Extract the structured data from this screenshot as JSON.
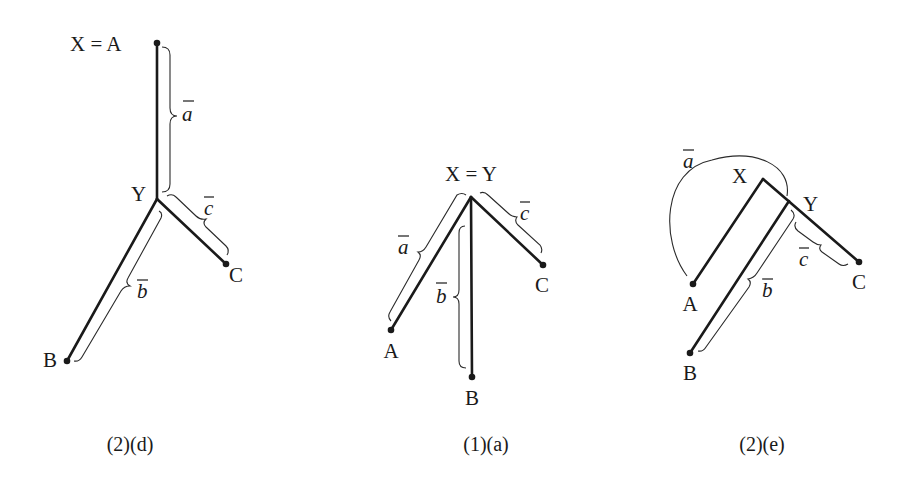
{
  "colors": {
    "ink": "#1a1a1a",
    "background": "#ffffff"
  },
  "diagrams": [
    {
      "caption": "(2)(d)",
      "labels": {
        "top": "X = A",
        "junction": "Y",
        "b_end": "B",
        "c_end": "C"
      },
      "segments": {
        "a": "a",
        "b": "b",
        "c": "c"
      },
      "points": {
        "A": [
          157,
          43
        ],
        "Y": [
          157,
          199
        ],
        "B": [
          67,
          361
        ],
        "C": [
          226,
          264
        ]
      }
    },
    {
      "caption": "(1)(a)",
      "labels": {
        "top": "X = Y",
        "a_end": "A",
        "b_end": "B",
        "c_end": "C"
      },
      "segments": {
        "a": "a",
        "b": "b",
        "c": "c"
      },
      "points": {
        "XY": [
          471,
          197
        ],
        "A": [
          391,
          330
        ],
        "B": [
          472,
          377
        ],
        "C": [
          543,
          265
        ]
      }
    },
    {
      "caption": "(2)(e)",
      "labels": {
        "x": "X",
        "y": "Y",
        "a_end": "A",
        "b_end": "B",
        "c_end": "C"
      },
      "segments": {
        "a": "a",
        "b": "b",
        "c": "c"
      },
      "points": {
        "X": [
          763,
          179
        ],
        "Y": [
          789,
          200
        ],
        "A": [
          693,
          284
        ],
        "B": [
          690,
          353
        ],
        "C": [
          859,
          262
        ]
      }
    }
  ]
}
